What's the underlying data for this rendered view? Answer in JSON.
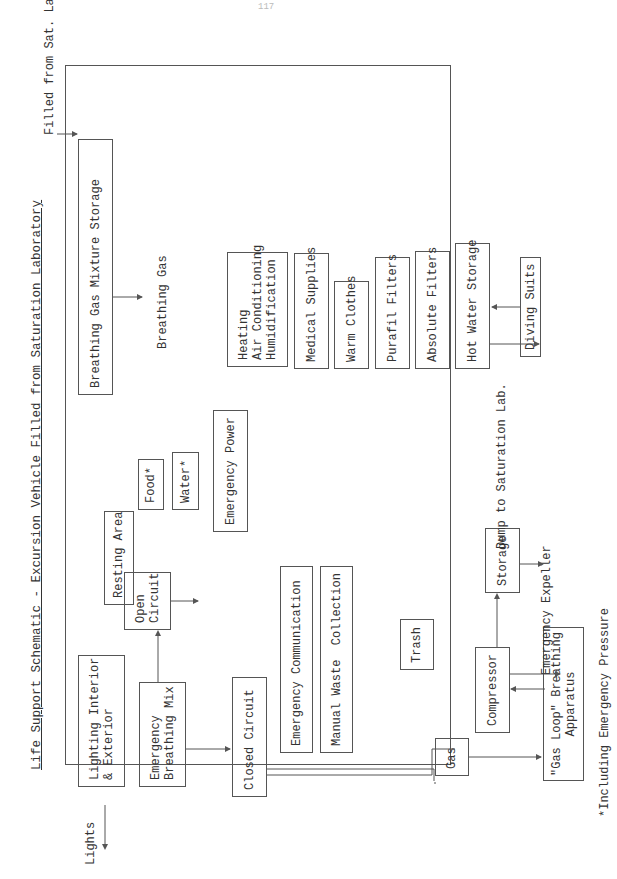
{
  "page_number": "117",
  "title": "Life Support Schematic - Excursion Vehicle Filled from Saturation Laboratory",
  "external_labels": {
    "filled_from": "Filled from Sat. Lab.",
    "lights": "Lights",
    "breathing_gas": "Breathing Gas",
    "dump": "Dump to Saturation Lab.",
    "emergency_expeller": "Emergency Expeller",
    "footnote": "*Including Emergency Pressure"
  },
  "boxes": {
    "breathing_gas_storage": "Breathing Gas Mixture Storage",
    "resting_area": "Resting Area",
    "lighting": "Lighting Interior\n& Exterior",
    "emergency_breathing_mix": "Emergency\nBreathing Mix",
    "open_circuit": "Open\nCircuit",
    "closed_circuit": "Closed Circuit",
    "food": "Food*",
    "water": "Water*",
    "emergency_power": "Emergency Power",
    "emergency_communication": "Emergency Communication",
    "manual_waste": "Manual Waste  Collection",
    "trash": "Trash",
    "gas": "Gas",
    "compressor": "Compressor",
    "storage": "Storage",
    "gas_loop": "\"Gas Loop\" Breathing\nApparatus",
    "heating": "Heating\nAir Conditioning\nHumidification",
    "medical": "Medical Supplies",
    "warm_clothes": "Warm Clothes",
    "purafil": "Purafil Filters",
    "absolute": "Absolute Filters",
    "hot_water": "Hot Water Storage",
    "diving_suits": "Diving Suits"
  }
}
